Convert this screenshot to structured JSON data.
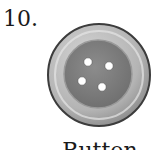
{
  "item": {
    "number": "10.",
    "caption": "Button",
    "icon": "button-icon",
    "colors": {
      "outer_rim": "#8a8a8a",
      "outer_face": "#bdbdbd",
      "inner_disk": "#7d7d7d",
      "holes": "#ffffff",
      "outline": "#3c3c3c"
    }
  }
}
